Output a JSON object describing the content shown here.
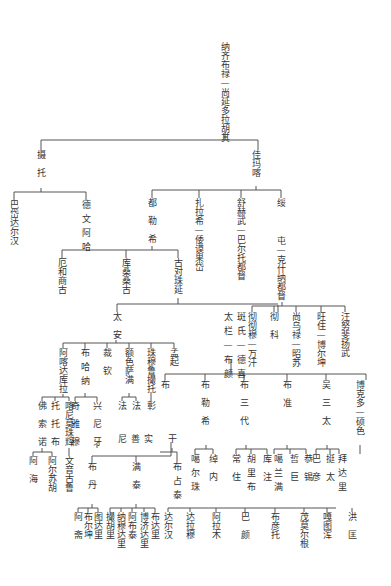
{
  "diagram": {
    "type": "genealogy-tree",
    "root": "纳齐布禄—尚延多拉胡其",
    "gen2": [
      "摄托",
      "佳玛喀"
    ],
    "shetuo_children": [
      "巴岱达尔汉",
      "德文阿哈"
    ],
    "jiamaka_children": [
      "都勒希",
      "扎拉希—倭谟果岱",
      "舒赫武—巴尔托都督",
      "绥"
    ],
    "sui_children": [
      "屯—克什纳都督"
    ],
    "dulexi_children": [
      "厄和商古",
      "库桑桑古",
      "古对珠延"
    ],
    "guduizhuyan_children": [
      "太安",
      "太栏—布颜"
    ],
    "shuhewu_children": [
      "斑氏—德喜"
    ],
    "tun_children": [
      "彻彻穆—万汗",
      "彻科",
      "尚乌禄—昭苏",
      "旺住—博尔坤",
      "汪努斐扬武"
    ],
    "taian_children": [
      "阿喀达库拉",
      "布哈纳",
      "裁钦",
      "额色萨满",
      "珠穆鲁撮托",
      "孟起"
    ],
    "akadakula_children": [
      "佛索诺",
      "托托布",
      "喀尼莫珠辉"
    ],
    "buhana_children": [
      "奇雅穆",
      "兴尼牙"
    ],
    "esesaman_children": [
      "法",
      "法"
    ],
    "zhumulu_children": [
      "彰"
    ],
    "fosuonuo_children": [
      "阿海",
      "阿尔苏胡"
    ],
    "kanimozhuhui_children": [
      "文音古鲁"
    ],
    "xingniya_children_row": [
      "尼善实",
      "干"
    ],
    "taolan_buyan_children": [
      "布",
      "布勒希",
      "布三代",
      "布准",
      "吴三太",
      "博克多—硕色"
    ],
    "nishanshi_children": [
      "布丹",
      "满泰"
    ],
    "gan_children": [
      "布占泰"
    ],
    "buda_children": [
      "阿斋",
      "布尔坤",
      "图达里"
    ],
    "mantai_children": [
      "撮胡里",
      "纳穆达里",
      "阿布泰",
      "博济达里",
      "布达里"
    ],
    "buzhantai_children": [
      "达尔汉"
    ],
    "bulexi_children": [
      "噶尔珠",
      "绰内"
    ],
    "busandai_children": [
      "常住",
      "胡里布",
      "库注"
    ],
    "buzhun_children": [
      "噶兰满",
      "哲巨",
      "恭锡"
    ],
    "wusantai_children": [
      "巴彦",
      "挺太",
      "拜达里"
    ],
    "bottom_row": [
      "达尔汉",
      "达拉穆",
      "阿拉木",
      "巴颜",
      "布彦托",
      "茂莫尔根",
      "嘎图浑",
      "洪匡"
    ]
  }
}
